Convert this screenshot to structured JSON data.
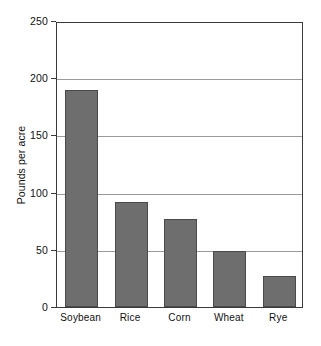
{
  "chart_data": {
    "type": "bar",
    "title": "",
    "subtitle": "",
    "xlabel": "",
    "ylabel": "Pounds per acre",
    "categories": [
      "Soybean",
      "Rice",
      "Corn",
      "Wheat",
      "Rye"
    ],
    "values": [
      190,
      92,
      77,
      49,
      27
    ],
    "series": [
      {
        "name": "Pounds per acre",
        "values": [
          190,
          92,
          77,
          49,
          27
        ]
      }
    ],
    "ylim": [
      0,
      250
    ],
    "yticks": [
      0,
      50,
      100,
      150,
      200,
      250
    ],
    "ytick_labels": [
      "0",
      "50",
      "100",
      "150",
      "200",
      "250"
    ],
    "grid": "horizontal",
    "legend": "none",
    "bar_color": "#6e6e6e",
    "bar_border_color": "#4a4a4a",
    "gridline_color": "#9a9a9a",
    "axis_color": "#3a3a3a",
    "background_color": "#ffffff",
    "annotations": []
  }
}
